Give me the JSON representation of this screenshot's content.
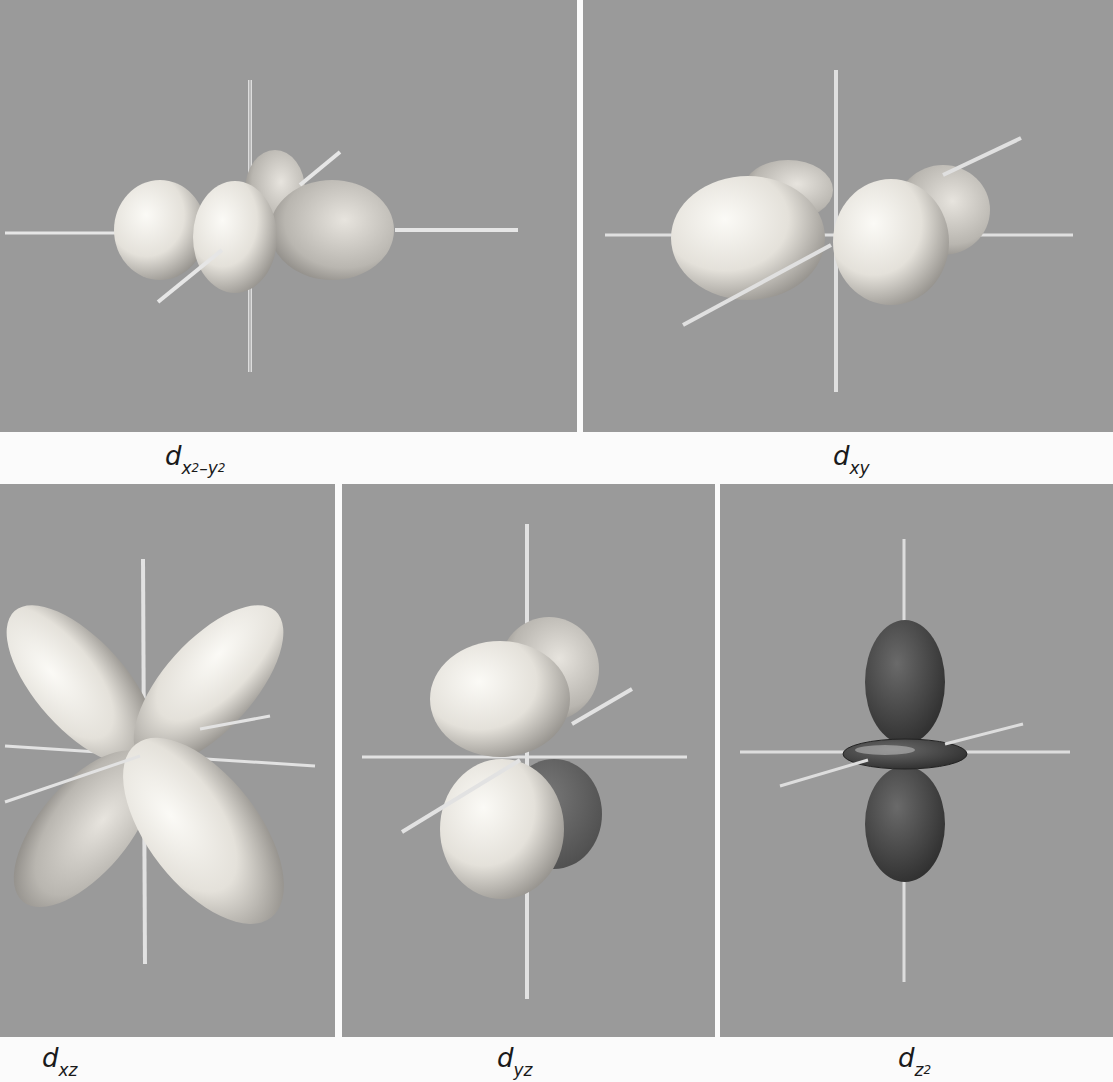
{
  "figure": {
    "panels": [
      {
        "id": "dx2-y2",
        "label_base": "d",
        "label_sub": "x",
        "label_sup1": "2",
        "label_mid": "–y",
        "label_sup2": "2",
        "label_full": "d x2-y2"
      },
      {
        "id": "dxy",
        "label_base": "d",
        "label_sub": "xy",
        "label_full": "d xy"
      },
      {
        "id": "dxz",
        "label_base": "d",
        "label_sub": "xz",
        "label_full": "d xz"
      },
      {
        "id": "dyz",
        "label_base": "d",
        "label_sub": "yz",
        "label_full": "d yz"
      },
      {
        "id": "dz2",
        "label_base": "d",
        "label_sub": "z",
        "label_sup1": "2",
        "label_full": "d z2"
      }
    ],
    "colors": {
      "background": "#9a9a9a",
      "page": "#fbfbfb",
      "lobe_light": "#f2f0ea",
      "lobe_dark": "#4a4a4a"
    }
  }
}
